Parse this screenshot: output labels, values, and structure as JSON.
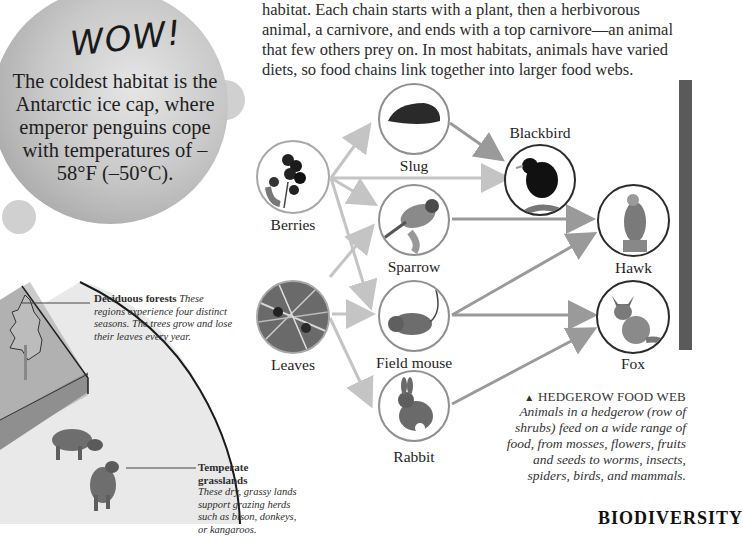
{
  "wow_box": {
    "title": "WOW!",
    "text": "The coldest habitat is the Antarctic ice cap, where emperor penguins cope with temperatures of –58°F (–50°C)."
  },
  "intro_paragraph": {
    "lines": [
      "habitat. Each chain starts with a plant, then a herbivorous",
      "animal, a carnivore, and ends with a top carnivore—an animal",
      "that few others prey on. In most habitats, animals have varied",
      "diets, so food chains link together into larger food webs."
    ]
  },
  "food_web": {
    "nodes": {
      "berries": {
        "label": "Berries",
        "icon": "berries-icon"
      },
      "leaves": {
        "label": "Leaves",
        "icon": "leaves-icon"
      },
      "slug": {
        "label": "Slug",
        "icon": "slug-icon"
      },
      "sparrow": {
        "label": "Sparrow",
        "icon": "sparrow-icon"
      },
      "field_mouse": {
        "label": "Field mouse",
        "icon": "mouse-icon"
      },
      "rabbit": {
        "label": "Rabbit",
        "icon": "rabbit-icon"
      },
      "blackbird": {
        "label": "Blackbird",
        "icon": "blackbird-icon"
      },
      "hawk": {
        "label": "Hawk",
        "icon": "hawk-icon"
      },
      "fox": {
        "label": "Fox",
        "icon": "fox-icon"
      }
    },
    "links": [
      [
        "berries",
        "slug"
      ],
      [
        "berries",
        "blackbird"
      ],
      [
        "berries",
        "sparrow"
      ],
      [
        "berries",
        "field_mouse"
      ],
      [
        "leaves",
        "sparrow"
      ],
      [
        "leaves",
        "field_mouse"
      ],
      [
        "leaves",
        "rabbit"
      ],
      [
        "slug",
        "blackbird"
      ],
      [
        "sparrow",
        "hawk"
      ],
      [
        "field_mouse",
        "hawk"
      ],
      [
        "field_mouse",
        "fox"
      ],
      [
        "rabbit",
        "fox"
      ]
    ],
    "colors": {
      "plant_arrow": "#c4c4c4",
      "animal_arrow": "#9a9a9a",
      "top_ring": "#2b2b2b"
    }
  },
  "caption": {
    "marker": "▲",
    "heading": "HEDGEROW FOOD WEB",
    "body": "Animals in a hedgerow (row of shrubs) feed on a wide range of food, from mosses, flowers, fruits and seeds to worms, insects, spiders, birds, and mammals."
  },
  "annotations": {
    "deciduous": {
      "title": "Deciduous forests",
      "text": "These regions experience four distinct seasons. The trees grow and lose their leaves every year."
    },
    "grasslands": {
      "title": "Temperate grasslands",
      "text": "These dry, grassy lands support grazing herds such as bison, donkeys, or kangaroos."
    }
  },
  "section_heading": "BIODIVERSITY"
}
